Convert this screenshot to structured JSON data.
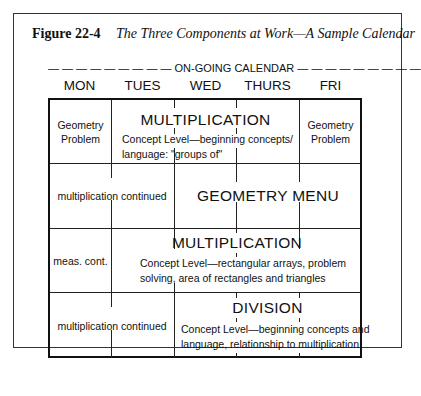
{
  "figure": {
    "number": "Figure 22-4",
    "title": "The Three Components at Work—A Sample Calendar"
  },
  "ongoing_label": "— — — — — — — — — ON-GOING CALENDAR — — — — — — — — —",
  "days": [
    "MON",
    "TUES",
    "WED",
    "THURS",
    "FRI"
  ],
  "rows": [
    {
      "mon": "Geometry Problem",
      "span_title": "MULTIPLICATION",
      "span_desc_1": "Concept Level—beginning concepts/",
      "span_desc_2": "language: \"groups of\"",
      "fri": "Geometry Problem"
    },
    {
      "mon_tues": "multiplication continued",
      "span_title": "GEOMETRY MENU"
    },
    {
      "mon": "meas. cont.",
      "span_title": "MULTIPLICATION",
      "span_desc_1": "Concept Level—rectangular arrays, problem",
      "span_desc_2": "solving, area of rectangles and triangles"
    },
    {
      "mon_tues": "multiplication continued",
      "span_title": "DIVISION",
      "span_desc_1": "Concept Level—beginning concepts and",
      "span_desc_2": "language, relationship to multiplication"
    }
  ]
}
